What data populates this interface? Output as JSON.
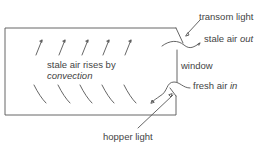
{
  "diagram": {
    "type": "window ventilation cross-section",
    "labels": {
      "transom_light": "transom light",
      "stale_air_out_prefix": "stale air ",
      "stale_air_out_emph": "out",
      "window": "window",
      "fresh_air_in_prefix": "fresh air ",
      "fresh_air_in_emph": "in",
      "hopper_light": "hopper light",
      "convection_line1": "stale air rises by",
      "convection_line2": "convection"
    },
    "colors": {
      "line": "#555555",
      "text": "#444444",
      "background": "#ffffff"
    }
  }
}
